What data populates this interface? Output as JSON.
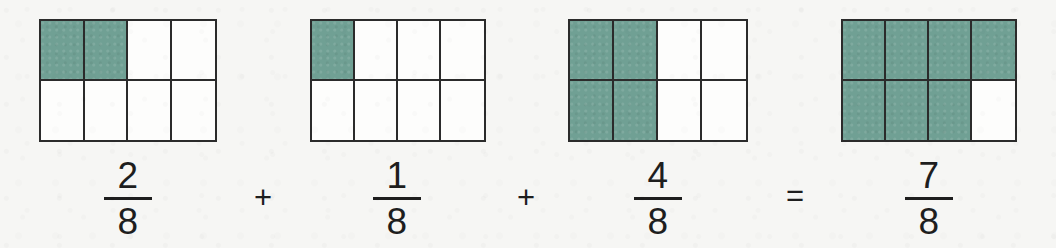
{
  "canvas": {
    "width": 1056,
    "height": 248,
    "background_color": "#f6f6f4",
    "description": "Fraction addition with shaded bar models"
  },
  "palette": {
    "shaded_fill": "#70a094",
    "unshaded_fill": "#fdfdfc",
    "grid_line": "#2b2b2b",
    "text": "#1e1e1e"
  },
  "chart_data": {
    "type": "bar",
    "title": "",
    "xlabel": "",
    "ylabel": "",
    "categories": [
      "2/8",
      "1/8",
      "4/8",
      "7/8"
    ],
    "values": [
      2,
      1,
      4,
      7
    ],
    "denominator": 8,
    "total_cells": 8,
    "grid_rows": 2,
    "grid_cols": 4,
    "equation": "2/8 + 1/8 + 4/8 = 7/8",
    "legend": [],
    "annotations": [
      "Each rectangle is divided into 8 equal parts (4 columns x 2 rows)."
    ]
  },
  "models": [
    {
      "name": "model-1",
      "numerator": 2,
      "denominator": 8,
      "shaded_count": 2,
      "cells": [
        true,
        true,
        false,
        false,
        false,
        false,
        false,
        false
      ]
    },
    {
      "name": "model-2",
      "numerator": 1,
      "denominator": 8,
      "shaded_count": 1,
      "cells": [
        true,
        false,
        false,
        false,
        false,
        false,
        false,
        false
      ]
    },
    {
      "name": "model-3",
      "numerator": 4,
      "denominator": 8,
      "shaded_count": 4,
      "cells": [
        true,
        true,
        false,
        false,
        true,
        true,
        false,
        false
      ]
    },
    {
      "name": "model-4",
      "numerator": 7,
      "denominator": 8,
      "shaded_count": 7,
      "cells": [
        true,
        true,
        true,
        true,
        true,
        true,
        true,
        false
      ]
    }
  ],
  "fractions": [
    {
      "numerator": "2",
      "denominator": "8"
    },
    {
      "numerator": "1",
      "denominator": "8"
    },
    {
      "numerator": "4",
      "denominator": "8"
    },
    {
      "numerator": "7",
      "denominator": "8"
    }
  ],
  "operators": {
    "plus_1": "+",
    "plus_2": "+",
    "equals": "="
  }
}
